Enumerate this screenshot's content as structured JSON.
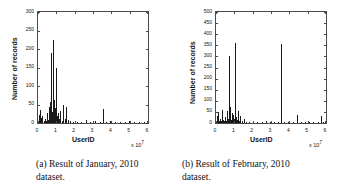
{
  "figure": {
    "panels": [
      {
        "id": "panel-a",
        "caption_line1": "(a) Result of January, 2010",
        "caption_line2": "dataset.",
        "chart": {
          "type": "bar",
          "title": "",
          "subtitle": "",
          "xlabel": "UserID",
          "ylabel": "Number of records",
          "x_multiplier": "x 10",
          "x_exponent": "7",
          "xlim": [
            0,
            6
          ],
          "ylim": [
            0,
            300
          ],
          "xticks": [
            0,
            1,
            2,
            3,
            4,
            5,
            6
          ],
          "xticklabels": [
            "0",
            "1",
            "2",
            "3",
            "4",
            "5",
            "6"
          ],
          "yticks": [
            0,
            50,
            100,
            150,
            200,
            250,
            300
          ],
          "yticklabels": [
            "0",
            "50",
            "100",
            "150",
            "200",
            "250",
            "300"
          ],
          "grid": false,
          "legend": null,
          "bar_color": "#1a1a1a",
          "x_units": "UserID (x 10^7)",
          "y_units": "Number of records",
          "data": [
            {
              "x": 0.04,
              "y": 22
            },
            {
              "x": 0.07,
              "y": 10
            },
            {
              "x": 0.11,
              "y": 35
            },
            {
              "x": 0.15,
              "y": 14
            },
            {
              "x": 0.19,
              "y": 8
            },
            {
              "x": 0.24,
              "y": 18
            },
            {
              "x": 0.3,
              "y": 6
            },
            {
              "x": 0.36,
              "y": 12
            },
            {
              "x": 0.42,
              "y": 5
            },
            {
              "x": 0.48,
              "y": 26
            },
            {
              "x": 0.54,
              "y": 9
            },
            {
              "x": 0.6,
              "y": 44
            },
            {
              "x": 0.63,
              "y": 16
            },
            {
              "x": 0.66,
              "y": 58
            },
            {
              "x": 0.69,
              "y": 11
            },
            {
              "x": 0.72,
              "y": 190
            },
            {
              "x": 0.75,
              "y": 30
            },
            {
              "x": 0.78,
              "y": 15
            },
            {
              "x": 0.81,
              "y": 225
            },
            {
              "x": 0.84,
              "y": 20
            },
            {
              "x": 0.87,
              "y": 62
            },
            {
              "x": 0.9,
              "y": 9
            },
            {
              "x": 0.94,
              "y": 40
            },
            {
              "x": 0.98,
              "y": 150
            },
            {
              "x": 1.02,
              "y": 18
            },
            {
              "x": 1.06,
              "y": 7
            },
            {
              "x": 1.1,
              "y": 28
            },
            {
              "x": 1.16,
              "y": 12
            },
            {
              "x": 1.22,
              "y": 33
            },
            {
              "x": 1.3,
              "y": 6
            },
            {
              "x": 1.38,
              "y": 48
            },
            {
              "x": 1.46,
              "y": 10
            },
            {
              "x": 1.55,
              "y": 42
            },
            {
              "x": 1.62,
              "y": 8
            },
            {
              "x": 1.72,
              "y": 5
            },
            {
              "x": 1.9,
              "y": 4
            },
            {
              "x": 2.1,
              "y": 3
            },
            {
              "x": 2.35,
              "y": 4
            },
            {
              "x": 2.62,
              "y": 7
            },
            {
              "x": 2.85,
              "y": 3
            },
            {
              "x": 3.1,
              "y": 5
            },
            {
              "x": 3.38,
              "y": 4
            },
            {
              "x": 3.52,
              "y": 37
            },
            {
              "x": 3.7,
              "y": 3
            },
            {
              "x": 3.95,
              "y": 5
            },
            {
              "x": 4.2,
              "y": 3
            },
            {
              "x": 4.48,
              "y": 4
            },
            {
              "x": 4.72,
              "y": 3
            },
            {
              "x": 4.98,
              "y": 5
            },
            {
              "x": 5.25,
              "y": 3
            },
            {
              "x": 5.52,
              "y": 4
            },
            {
              "x": 5.78,
              "y": 3
            }
          ]
        }
      },
      {
        "id": "panel-b",
        "caption_line1": "(b) Result of February, 2010",
        "caption_line2": "dataset.",
        "chart": {
          "type": "bar",
          "title": "",
          "subtitle": "",
          "xlabel": "UserID",
          "ylabel": "Number of records",
          "x_multiplier": "x 10",
          "x_exponent": "7",
          "xlim": [
            0,
            6
          ],
          "ylim": [
            0,
            500
          ],
          "xticks": [
            0,
            1,
            2,
            3,
            4,
            5,
            6
          ],
          "xticklabels": [
            "0",
            "1",
            "2",
            "3",
            "4",
            "5",
            "6"
          ],
          "yticks": [
            0,
            50,
            100,
            150,
            200,
            250,
            300,
            350,
            400,
            450,
            500
          ],
          "yticklabels": [
            "0",
            "50",
            "100",
            "150",
            "200",
            "250",
            "300",
            "350",
            "400",
            "450",
            "500"
          ],
          "grid": false,
          "legend": null,
          "bar_color": "#1a1a1a",
          "x_units": "UserID (x 10^7)",
          "y_units": "Number of records",
          "data": [
            {
              "x": 0.05,
              "y": 30
            },
            {
              "x": 0.09,
              "y": 12
            },
            {
              "x": 0.13,
              "y": 48
            },
            {
              "x": 0.17,
              "y": 9
            },
            {
              "x": 0.22,
              "y": 20
            },
            {
              "x": 0.27,
              "y": 7
            },
            {
              "x": 0.32,
              "y": 60
            },
            {
              "x": 0.38,
              "y": 14
            },
            {
              "x": 0.44,
              "y": 8
            },
            {
              "x": 0.5,
              "y": 25
            },
            {
              "x": 0.56,
              "y": 10
            },
            {
              "x": 0.62,
              "y": 55
            },
            {
              "x": 0.66,
              "y": 18
            },
            {
              "x": 0.7,
              "y": 300
            },
            {
              "x": 0.74,
              "y": 22
            },
            {
              "x": 0.78,
              "y": 70
            },
            {
              "x": 0.82,
              "y": 15
            },
            {
              "x": 0.86,
              "y": 45
            },
            {
              "x": 0.9,
              "y": 11
            },
            {
              "x": 0.95,
              "y": 38
            },
            {
              "x": 1.0,
              "y": 18
            },
            {
              "x": 1.05,
              "y": 360
            },
            {
              "x": 1.09,
              "y": 26
            },
            {
              "x": 1.14,
              "y": 12
            },
            {
              "x": 1.2,
              "y": 52
            },
            {
              "x": 1.26,
              "y": 9
            },
            {
              "x": 1.33,
              "y": 30
            },
            {
              "x": 1.42,
              "y": 7
            },
            {
              "x": 1.52,
              "y": 18
            },
            {
              "x": 1.65,
              "y": 6
            },
            {
              "x": 1.8,
              "y": 5
            },
            {
              "x": 2.0,
              "y": 4
            },
            {
              "x": 2.25,
              "y": 6
            },
            {
              "x": 2.5,
              "y": 4
            },
            {
              "x": 2.72,
              "y": 8
            },
            {
              "x": 2.92,
              "y": 5
            },
            {
              "x": 3.15,
              "y": 4
            },
            {
              "x": 3.4,
              "y": 6
            },
            {
              "x": 3.55,
              "y": 355
            },
            {
              "x": 3.72,
              "y": 5
            },
            {
              "x": 3.95,
              "y": 4
            },
            {
              "x": 4.18,
              "y": 6
            },
            {
              "x": 4.4,
              "y": 35
            },
            {
              "x": 4.62,
              "y": 4
            },
            {
              "x": 4.85,
              "y": 5
            },
            {
              "x": 5.08,
              "y": 3
            },
            {
              "x": 5.3,
              "y": 5
            },
            {
              "x": 5.55,
              "y": 4
            },
            {
              "x": 5.7,
              "y": 30
            },
            {
              "x": 5.85,
              "y": 4
            }
          ]
        }
      }
    ]
  },
  "chart_data": [
    {
      "type": "bar",
      "title": "(a) Result of January, 2010 dataset.",
      "xlabel": "UserID",
      "ylabel": "Number of records",
      "xlim": [
        0,
        60000000
      ],
      "ylim": [
        0,
        300
      ],
      "x_tick_multiplier": "x 10^7",
      "categories": [
        "0",
        "1",
        "2",
        "3",
        "4",
        "5",
        "6"
      ],
      "yticklabels": [
        "0",
        "50",
        "100",
        "150",
        "200",
        "250",
        "300"
      ],
      "grid": false,
      "legend": null,
      "series": [
        {
          "name": "Number of records",
          "x": [
            0.04,
            0.07,
            0.11,
            0.15,
            0.19,
            0.24,
            0.3,
            0.36,
            0.42,
            0.48,
            0.54,
            0.6,
            0.63,
            0.66,
            0.69,
            0.72,
            0.75,
            0.78,
            0.81,
            0.84,
            0.87,
            0.9,
            0.94,
            0.98,
            1.02,
            1.06,
            1.1,
            1.16,
            1.22,
            1.3,
            1.38,
            1.46,
            1.55,
            1.62,
            1.72,
            1.9,
            2.1,
            2.35,
            2.62,
            2.85,
            3.1,
            3.38,
            3.52,
            3.7,
            3.95,
            4.2,
            4.48,
            4.72,
            4.98,
            5.25,
            5.52,
            5.78
          ],
          "values": [
            22,
            10,
            35,
            14,
            8,
            18,
            6,
            12,
            5,
            26,
            9,
            44,
            16,
            58,
            11,
            190,
            30,
            15,
            225,
            20,
            62,
            9,
            40,
            150,
            18,
            7,
            28,
            12,
            33,
            6,
            48,
            10,
            42,
            8,
            5,
            4,
            3,
            4,
            7,
            3,
            5,
            4,
            37,
            3,
            5,
            3,
            4,
            3,
            5,
            3,
            4,
            3
          ]
        }
      ]
    },
    {
      "type": "bar",
      "title": "(b) Result of February, 2010 dataset.",
      "xlabel": "UserID",
      "ylabel": "Number of records",
      "xlim": [
        0,
        60000000
      ],
      "ylim": [
        0,
        500
      ],
      "x_tick_multiplier": "x 10^7",
      "categories": [
        "0",
        "1",
        "2",
        "3",
        "4",
        "5",
        "6"
      ],
      "yticklabels": [
        "0",
        "50",
        "100",
        "150",
        "200",
        "250",
        "300",
        "350",
        "400",
        "450",
        "500"
      ],
      "grid": false,
      "legend": null,
      "series": [
        {
          "name": "Number of records",
          "x": [
            0.05,
            0.09,
            0.13,
            0.17,
            0.22,
            0.27,
            0.32,
            0.38,
            0.44,
            0.5,
            0.56,
            0.62,
            0.66,
            0.7,
            0.74,
            0.78,
            0.82,
            0.86,
            0.9,
            0.95,
            1.0,
            1.05,
            1.09,
            1.14,
            1.2,
            1.26,
            1.33,
            1.42,
            1.52,
            1.65,
            1.8,
            2.0,
            2.25,
            2.5,
            2.72,
            2.92,
            3.15,
            3.4,
            3.55,
            3.72,
            3.95,
            4.18,
            4.4,
            4.62,
            4.85,
            5.08,
            5.3,
            5.55,
            5.7,
            5.85
          ],
          "values": [
            30,
            12,
            48,
            9,
            20,
            7,
            60,
            14,
            8,
            25,
            10,
            55,
            18,
            300,
            22,
            70,
            15,
            45,
            11,
            38,
            18,
            360,
            26,
            12,
            52,
            9,
            30,
            7,
            18,
            6,
            5,
            4,
            6,
            4,
            8,
            5,
            4,
            6,
            355,
            5,
            4,
            6,
            35,
            4,
            5,
            3,
            5,
            4,
            30,
            4
          ]
        }
      ]
    }
  ]
}
